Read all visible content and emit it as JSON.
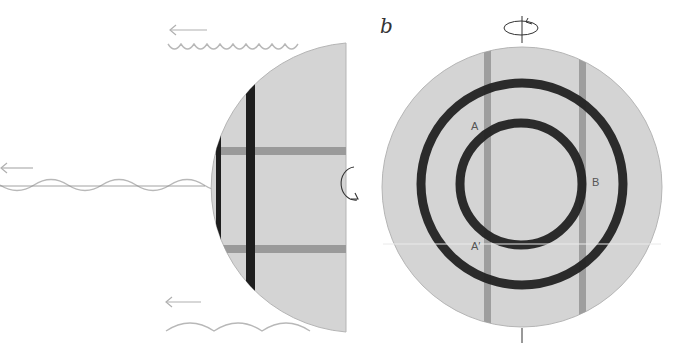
{
  "figure": {
    "panels": [
      {
        "id": "a",
        "label": "",
        "description": "Side view of hemisphere emitting waves",
        "hemisphere": {
          "fill": "#d4d4d4",
          "edge": "#b5b5b5"
        },
        "dark_bars_color": "#1e1e1e",
        "bands_color": "#9a9a9a",
        "wave_color": "#b8b8b8",
        "arrow_color": "#b0b0b0",
        "rotation_symbol": "counterclockwise-rotation"
      },
      {
        "id": "b",
        "label": "b",
        "description": "Top view of disc with concentric rings",
        "disc": {
          "fill": "#d4d4d4",
          "edge": "#b5b5b5"
        },
        "ring_color": "#222222",
        "band_color": "#9e9e9e",
        "points": [
          {
            "name": "A",
            "text": "A"
          },
          {
            "name": "B",
            "text": "B"
          },
          {
            "name": "A-prime",
            "text": "A′"
          }
        ]
      }
    ]
  }
}
